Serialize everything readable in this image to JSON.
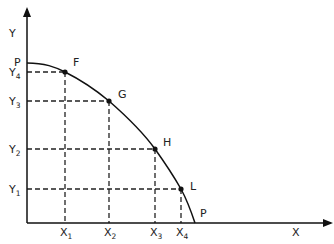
{
  "diagram": {
    "type": "production-possibility-frontier",
    "axes": {
      "x_label": "X",
      "y_label": "Y"
    },
    "curve_label_top": "P",
    "curve_label_bottom": "P",
    "points": [
      {
        "name": "F",
        "x_tick": "X",
        "x_sub": "1",
        "y_tick": "Y",
        "y_sub": "4"
      },
      {
        "name": "G",
        "x_tick": "X",
        "x_sub": "2",
        "y_tick": "Y",
        "y_sub": "3"
      },
      {
        "name": "H",
        "x_tick": "X",
        "x_sub": "3",
        "y_tick": "Y",
        "y_sub": "2"
      },
      {
        "name": "L",
        "x_tick": "X",
        "x_sub": "4",
        "y_tick": "Y",
        "y_sub": "1"
      }
    ],
    "colors": {
      "line": "#111111",
      "text": "#222222",
      "background": "#ffffff"
    }
  }
}
